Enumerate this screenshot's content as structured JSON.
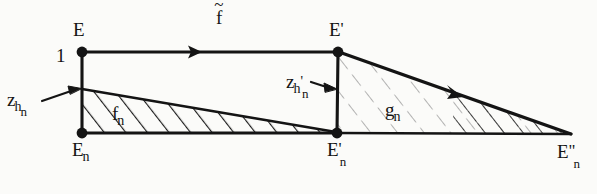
{
  "figure": {
    "kind": "hand-drawn mathematical commutative-style diagram",
    "background_color": "#fbfbf9",
    "ink_color": "#141414"
  },
  "labels": {
    "E": "E",
    "one": "1",
    "f_tilde_base": "f",
    "f_tilde_accent": "~",
    "E_prime_base": "E",
    "E_prime_mark": "'",
    "z_base": "z",
    "z_sub_h": "h",
    "z_subsub_n": "n",
    "zp_base": "z",
    "zp_sub_h": "h",
    "zp_sub_prime": "'",
    "zp_subsub_n": "n",
    "f_n_base": "f",
    "f_n_sub": "n",
    "g_n_base": "g",
    "g_n_sub": "n",
    "E_n_base": "E",
    "E_n_sub": "n",
    "E_n_prime_base": "E",
    "E_n_prime_mark": "'",
    "E_n_prime_sub": "n",
    "E_n_dprime_base": "E",
    "E_n_dprime_mark": "\"",
    "E_n_dprime_sub": "n"
  },
  "vertices": [
    {
      "name": "E",
      "x": 82,
      "y": 52
    },
    {
      "name": "E-prime",
      "x": 338,
      "y": 52
    },
    {
      "name": "E-n",
      "x": 82,
      "y": 133
    },
    {
      "name": "E-n-prime",
      "x": 337,
      "y": 133
    },
    {
      "name": "E-n-dprime",
      "x": 570,
      "y": 134
    }
  ],
  "edges": [
    {
      "name": "top-edge-E-to-Eprime",
      "from": "E",
      "to": "E-prime",
      "arrow_at_x": 195,
      "label": "f-tilde"
    },
    {
      "name": "left-vertical-E-to-En",
      "from": "E",
      "to": "E-n",
      "label": "1"
    },
    {
      "name": "mid-vertical-Eprime-to-Enprime",
      "from": "E-prime",
      "to": "E-n-prime",
      "label": "z-h-prime-n"
    },
    {
      "name": "bottom-edge-En-to-Enprime",
      "from": "E-n",
      "to": "E-n-prime"
    },
    {
      "name": "bottom-edge-Enprime-to-Endprime",
      "from": "E-n-prime",
      "to": "E-n-dprime"
    },
    {
      "name": "slant-fn-top",
      "from_x": 82,
      "from_y": 89,
      "to_x": 337,
      "to_y": 132,
      "label": "f-n"
    },
    {
      "name": "diagonal-gn-hypotenuse",
      "from": "E-prime",
      "to": "E-n-dprime",
      "arrow_at_x": 455,
      "label": "g-n"
    }
  ],
  "regions": [
    {
      "name": "f-n-wedge",
      "label": "f_n",
      "hatched": true,
      "hatch_strength": "strong"
    },
    {
      "name": "g-n-triangle",
      "label": "g_n",
      "hatched": true,
      "hatch_strength": "faint"
    }
  ],
  "annotation_arrows": [
    {
      "name": "z-h-n-pointer",
      "from_x": 42,
      "from_y": 101,
      "to_x": 80,
      "to_y": 89
    },
    {
      "name": "z-h-prime-n-pointer",
      "from_x": 310,
      "from_y": 83,
      "to_x": 336,
      "to_y": 88
    }
  ]
}
